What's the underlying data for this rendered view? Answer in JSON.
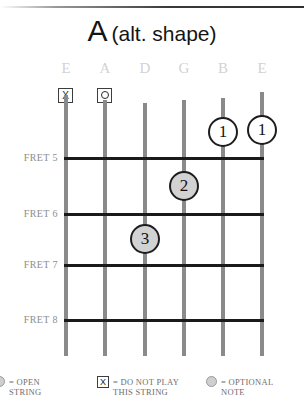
{
  "title": {
    "chord": "A",
    "variant": "(alt. shape)"
  },
  "strings": [
    {
      "label": "E",
      "x": 66,
      "marker": "x",
      "top": 95
    },
    {
      "label": "A",
      "x": 105,
      "marker": "o",
      "top": 100
    },
    {
      "label": "D",
      "x": 145,
      "marker": "",
      "top": 103
    },
    {
      "label": "G",
      "x": 184,
      "marker": "",
      "top": 100
    },
    {
      "label": "B",
      "x": 223,
      "marker": "",
      "top": 98
    },
    {
      "label": "E",
      "x": 262,
      "marker": "",
      "top": 92
    }
  ],
  "frets": [
    {
      "label": "FRET 5",
      "y": 157
    },
    {
      "label": "FRET 6",
      "y": 213
    },
    {
      "label": "FRET 7",
      "y": 264
    },
    {
      "label": "FRET 8",
      "y": 319
    }
  ],
  "fingerings": [
    {
      "finger": "1",
      "string": 4,
      "x": 223,
      "y": 132,
      "style": "open"
    },
    {
      "finger": "1",
      "string": 5,
      "x": 262,
      "y": 130,
      "style": "open"
    },
    {
      "finger": "2",
      "string": 3,
      "x": 184,
      "y": 186,
      "style": "filled"
    },
    {
      "finger": "3",
      "string": 2,
      "x": 145,
      "y": 239,
      "style": "filled"
    }
  ],
  "legend": [
    {
      "icon": "open-string-circle",
      "text": "= OPEN\nSTRING",
      "x": -6
    },
    {
      "icon": "do-not-play-x-box",
      "text": "= DO NOT PLAY\nTHIS STRING",
      "x": 97
    },
    {
      "icon": "optional-note-circle",
      "text": "= OPTIONAL\nNOTE",
      "x": 206
    }
  ],
  "colors": {
    "string": "#8a8a8a",
    "fret": "#1a1a1a",
    "label": "#8e8e8e",
    "filled_note": "#d2d2d2"
  }
}
